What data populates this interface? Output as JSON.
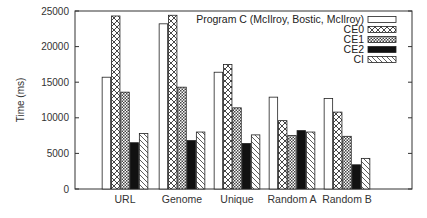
{
  "chart_data": {
    "type": "bar",
    "title": "",
    "xlabel": "",
    "ylabel": "Time (ms)",
    "ylim": [
      0,
      25000
    ],
    "yticks": [
      0,
      5000,
      10000,
      15000,
      20000,
      25000
    ],
    "grid": false,
    "legend_position": "top-right",
    "categories": [
      "URL",
      "Genome",
      "Unique",
      "Random A",
      "Random B"
    ],
    "series": [
      {
        "name": "Program C (McIlroy, Bostic, McIlroy)",
        "pattern": "empty",
        "values": [
          15700,
          23200,
          16400,
          12900,
          12700
        ]
      },
      {
        "name": "CE0",
        "pattern": "crosshatch",
        "values": [
          24300,
          24400,
          17500,
          9600,
          10800
        ]
      },
      {
        "name": "CE1",
        "pattern": "dense-check",
        "values": [
          13600,
          14300,
          11400,
          7500,
          7400
        ]
      },
      {
        "name": "CE2",
        "pattern": "solid-black",
        "values": [
          6500,
          6800,
          6400,
          8200,
          3400
        ]
      },
      {
        "name": "CI",
        "pattern": "diagonal",
        "values": [
          7800,
          8000,
          7600,
          8000,
          4300
        ]
      }
    ]
  },
  "colors": {
    "axis": "#333333",
    "bar_outline": "#222222",
    "ce2_fill": "#111111"
  }
}
